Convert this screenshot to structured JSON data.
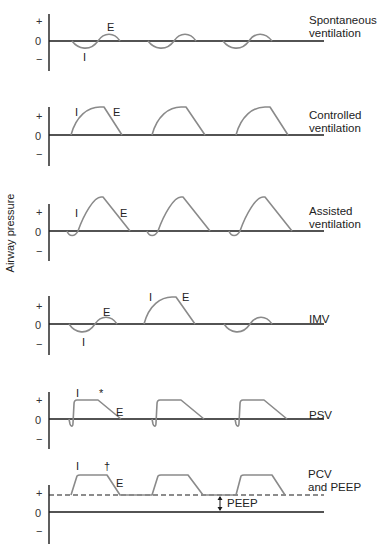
{
  "figure": {
    "y_axis_label": "Airway pressure",
    "tick_labels": {
      "plus": "+",
      "zero": "0",
      "minus": "−"
    },
    "colors": {
      "axis": "#1a1a1a",
      "waveform": "#8a8a8a",
      "text": "#222222"
    }
  },
  "panels": [
    {
      "id": "spontaneous",
      "mode_label_line1": "Spontaneous",
      "mode_label_line2": "ventilation",
      "annotations": {
        "inspiration": "I",
        "expiration": "E"
      }
    },
    {
      "id": "controlled",
      "mode_label_line1": "Controlled",
      "mode_label_line2": "ventilation",
      "annotations": {
        "inspiration": "I",
        "expiration": "E"
      }
    },
    {
      "id": "assisted",
      "mode_label_line1": "Assisted",
      "mode_label_line2": "ventilation",
      "annotations": {
        "inspiration": "I",
        "expiration": "E"
      }
    },
    {
      "id": "imv",
      "mode_label_line1": "IMV",
      "annotations": {
        "spont_inspiration": "I",
        "spont_expiration": "E",
        "mech_inspiration": "I",
        "mech_expiration": "E"
      }
    },
    {
      "id": "psv",
      "mode_label_line1": "PSV",
      "annotations": {
        "inspiration": "I",
        "marker": "*",
        "expiration": "E"
      }
    },
    {
      "id": "pcv_peep",
      "mode_label_line1": "PCV",
      "mode_label_line2": "and PEEP",
      "annotations": {
        "inspiration": "I",
        "marker": "†",
        "expiration": "E",
        "peep": "PEEP"
      }
    }
  ]
}
